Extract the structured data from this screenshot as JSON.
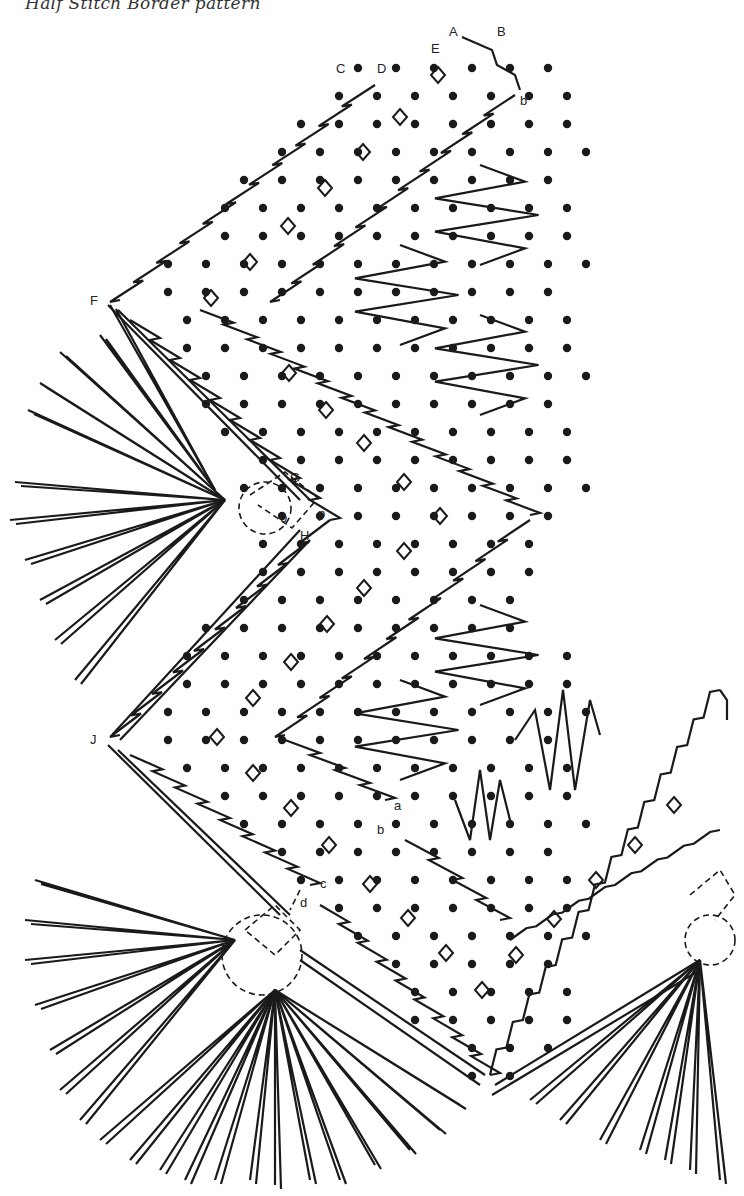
{
  "title": "Half Stitch Border pattern",
  "labels": [
    {
      "text": "A",
      "x": 449,
      "y": 36
    },
    {
      "text": "B",
      "x": 497,
      "y": 36
    },
    {
      "text": "E",
      "x": 431,
      "y": 53
    },
    {
      "text": "C",
      "x": 336,
      "y": 73
    },
    {
      "text": "D",
      "x": 377,
      "y": 73
    },
    {
      "text": "b",
      "x": 520,
      "y": 105
    },
    {
      "text": "F",
      "x": 90,
      "y": 305
    },
    {
      "text": "G",
      "x": 290,
      "y": 482
    },
    {
      "text": "o",
      "x": 280,
      "y": 522
    },
    {
      "text": "p",
      "x": 318,
      "y": 518
    },
    {
      "text": "H",
      "x": 300,
      "y": 540
    },
    {
      "text": "J",
      "x": 90,
      "y": 744
    },
    {
      "text": "a",
      "x": 394,
      "y": 810
    },
    {
      "text": "b",
      "x": 377,
      "y": 834
    },
    {
      "text": "c",
      "x": 320,
      "y": 888
    },
    {
      "text": "d",
      "x": 300,
      "y": 907
    }
  ],
  "colors": {
    "ink": "#1a1a1a",
    "paper": "#ffffff"
  }
}
